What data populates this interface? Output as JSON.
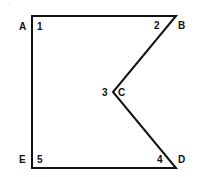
{
  "diagram": {
    "type": "polygon",
    "stroke_color": "#111111",
    "background": "#ffffff",
    "vertices": [
      {
        "label": "A",
        "angle_number": "1",
        "x": 32,
        "y": 16
      },
      {
        "label": "B",
        "angle_number": "2",
        "x": 176,
        "y": 16
      },
      {
        "label": "C",
        "angle_number": "3",
        "x": 113,
        "y": 92
      },
      {
        "label": "D",
        "angle_number": "4",
        "x": 176,
        "y": 168
      },
      {
        "label": "E",
        "angle_number": "5",
        "x": 32,
        "y": 168
      }
    ],
    "labels": {
      "A": "A",
      "B": "B",
      "C": "C",
      "D": "D",
      "E": "E",
      "n1": "1",
      "n2": "2",
      "n3": "3",
      "n4": "4",
      "n5": "5"
    }
  }
}
